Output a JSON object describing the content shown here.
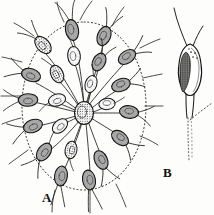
{
  "figure": {
    "type": "scientific-line-drawing",
    "background_color": "#fdfdfc",
    "ink_color": "#1a1a1a",
    "panels": [
      {
        "id": "A",
        "label": "A",
        "label_x": 45,
        "label_y": 198,
        "caption": "A",
        "description": "radial colony of stalked flagellate cells within a dotted gelatinous envelope",
        "envelope": {
          "shape": "rounded-oval",
          "style": "dotted",
          "center_x": 84,
          "center_y": 106,
          "radius_x": 62,
          "radius_y": 84
        },
        "hub": {
          "x": 84,
          "y": 113,
          "rx": 9,
          "ry": 11
        },
        "cell_count": 22,
        "cells": [
          {
            "id": 1,
            "x": 72,
            "y": 30,
            "angle": -100,
            "len": 20,
            "wid": 11,
            "flagella": 2,
            "flag_len": 26,
            "shade": 0.75
          },
          {
            "id": 2,
            "x": 104,
            "y": 36,
            "angle": -62,
            "len": 19,
            "wid": 11,
            "flagella": 2,
            "flag_len": 24,
            "shade": 0.7
          },
          {
            "id": 3,
            "x": 43,
            "y": 45,
            "angle": -138,
            "len": 19,
            "wid": 11,
            "flagella": 2,
            "flag_len": 25,
            "shade": 0.6
          },
          {
            "id": 4,
            "x": 127,
            "y": 57,
            "angle": -34,
            "len": 18,
            "wid": 11,
            "flagella": 2,
            "flag_len": 23,
            "shade": 0.7
          },
          {
            "id": 5,
            "x": 74,
            "y": 56,
            "angle": -96,
            "len": 18,
            "wid": 11,
            "flagella": 1,
            "flag_len": 20,
            "shade": 0.45
          },
          {
            "id": 6,
            "x": 99,
            "y": 62,
            "angle": -56,
            "len": 18,
            "wid": 11,
            "flagella": 2,
            "flag_len": 22,
            "shade": 0.78
          },
          {
            "id": 7,
            "x": 31,
            "y": 75,
            "angle": -168,
            "len": 18,
            "wid": 11,
            "flagella": 2,
            "flag_len": 24,
            "shade": 0.72
          },
          {
            "id": 8,
            "x": 57,
            "y": 74,
            "angle": -120,
            "len": 18,
            "wid": 11,
            "flagella": 1,
            "flag_len": 21,
            "shade": 0.55
          },
          {
            "id": 9,
            "x": 121,
            "y": 85,
            "angle": -20,
            "len": 18,
            "wid": 11,
            "flagella": 2,
            "flag_len": 23,
            "shade": 0.74
          },
          {
            "id": 10,
            "x": 91,
            "y": 84,
            "angle": -70,
            "len": 17,
            "wid": 10,
            "flagella": 1,
            "flag_len": 19,
            "shade": 0.5
          },
          {
            "id": 11,
            "x": 28,
            "y": 100,
            "angle": 178,
            "len": 18,
            "wid": 11,
            "flagella": 2,
            "flag_len": 24,
            "shade": 0.7
          },
          {
            "id": 12,
            "x": 57,
            "y": 100,
            "angle": 160,
            "len": 17,
            "wid": 11,
            "flagella": 1,
            "flag_len": 20,
            "shade": 0.55
          },
          {
            "id": 13,
            "x": 107,
            "y": 104,
            "angle": -8,
            "len": 17,
            "wid": 10,
            "flagella": 1,
            "flag_len": 18,
            "shade": 0.45
          },
          {
            "id": 14,
            "x": 129,
            "y": 112,
            "angle": 8,
            "len": 18,
            "wid": 11,
            "flagella": 2,
            "flag_len": 23,
            "shade": 0.76
          },
          {
            "id": 15,
            "x": 33,
            "y": 126,
            "angle": 160,
            "len": 18,
            "wid": 11,
            "flagella": 2,
            "flag_len": 24,
            "shade": 0.68
          },
          {
            "id": 16,
            "x": 60,
            "y": 126,
            "angle": 140,
            "len": 17,
            "wid": 11,
            "flagella": 1,
            "flag_len": 20,
            "shade": 0.55
          },
          {
            "id": 17,
            "x": 120,
            "y": 138,
            "angle": 30,
            "len": 18,
            "wid": 11,
            "flagella": 2,
            "flag_len": 23,
            "shade": 0.72
          },
          {
            "id": 18,
            "x": 44,
            "y": 152,
            "angle": 124,
            "len": 18,
            "wid": 11,
            "flagella": 2,
            "flag_len": 24,
            "shade": 0.7
          },
          {
            "id": 19,
            "x": 71,
            "y": 150,
            "angle": 104,
            "len": 17,
            "wid": 11,
            "flagella": 1,
            "flag_len": 20,
            "shade": 0.58
          },
          {
            "id": 20,
            "x": 101,
            "y": 160,
            "angle": 62,
            "len": 18,
            "wid": 11,
            "flagella": 2,
            "flag_len": 24,
            "shade": 0.74
          },
          {
            "id": 21,
            "x": 61,
            "y": 176,
            "angle": 100,
            "len": 18,
            "wid": 11,
            "flagella": 2,
            "flag_len": 26,
            "shade": 0.7
          },
          {
            "id": 22,
            "x": 89,
            "y": 180,
            "angle": 76,
            "len": 18,
            "wid": 11,
            "flagella": 2,
            "flag_len": 26,
            "shade": 0.78
          }
        ]
      },
      {
        "id": "B",
        "label": "B",
        "label_x": 166,
        "label_y": 173,
        "caption": "B",
        "description": "single enlarged flagellate cell with two flagella, stippled chromatophore and tapering stalk",
        "cell": {
          "apex_x": 190,
          "apex_y": 44,
          "body_cx": 189,
          "body_cy": 70,
          "body_rx": 13,
          "body_ry": 26,
          "chromatophore": "dark stippled mass, left side of body",
          "granule_count": 5,
          "flagella": [
            {
              "id": 1,
              "length": 46,
              "direction": "upper-left"
            },
            {
              "id": 2,
              "length": 22,
              "direction": "upper-right"
            }
          ],
          "stalk": {
            "top_y": 96,
            "solid_to_y": 118,
            "dotted_to_y": 160
          },
          "branch": {
            "style": "dotted",
            "direction": "upper-right"
          }
        }
      }
    ]
  }
}
